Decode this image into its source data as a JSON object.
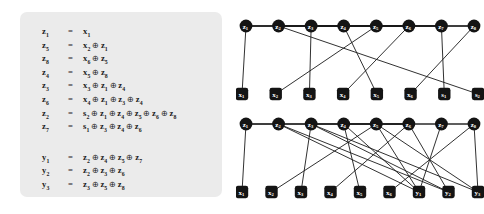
{
  "equations": {
    "z_block": [
      {
        "lhs": "z1",
        "eq": "=",
        "terms": [
          "x1"
        ]
      },
      {
        "lhs": "z5",
        "eq": "=",
        "terms": [
          "x2",
          "z1"
        ]
      },
      {
        "lhs": "z8",
        "eq": "=",
        "terms": [
          "x6",
          "z5"
        ]
      },
      {
        "lhs": "z4",
        "eq": "=",
        "terms": [
          "x5",
          "z8"
        ]
      },
      {
        "lhs": "z3",
        "eq": "=",
        "terms": [
          "x3",
          "z1",
          "z4"
        ]
      },
      {
        "lhs": "z6",
        "eq": "=",
        "terms": [
          "x4",
          "z1",
          "z3",
          "z4"
        ]
      },
      {
        "lhs": "z2",
        "eq": "=",
        "terms": [
          "s2",
          "z1",
          "z4",
          "z5",
          "z6",
          "z8"
        ]
      },
      {
        "lhs": "z7",
        "eq": "=",
        "terms": [
          "s1",
          "z3",
          "z4",
          "z6"
        ]
      }
    ],
    "y_block": [
      {
        "lhs": "y1",
        "eq": "=",
        "terms": [
          "z2",
          "z4",
          "z5",
          "z7"
        ]
      },
      {
        "lhs": "y2",
        "eq": "=",
        "terms": [
          "z2",
          "z3",
          "z6"
        ]
      },
      {
        "lhs": "y3",
        "eq": "=",
        "terms": [
          "z3",
          "z5",
          "z8"
        ]
      }
    ],
    "operator": "⊕",
    "equals": "="
  },
  "graph_top": {
    "top_nodes": [
      "z1",
      "z2",
      "z3",
      "z4",
      "z5",
      "z6",
      "z7",
      "z8"
    ],
    "bottom_nodes": [
      "x1",
      "x2",
      "x3",
      "x4",
      "x5",
      "x6",
      "s1",
      "s2"
    ],
    "edges": [
      [
        "z1",
        "x1"
      ],
      [
        "z5",
        "x2"
      ],
      [
        "z5",
        "z1"
      ],
      [
        "z8",
        "x6"
      ],
      [
        "z8",
        "z5"
      ],
      [
        "z4",
        "x5"
      ],
      [
        "z4",
        "z8"
      ],
      [
        "z3",
        "x3"
      ],
      [
        "z3",
        "z1"
      ],
      [
        "z3",
        "z4"
      ],
      [
        "z6",
        "x4"
      ],
      [
        "z6",
        "z1"
      ],
      [
        "z6",
        "z3"
      ],
      [
        "z6",
        "z4"
      ],
      [
        "z2",
        "s2"
      ],
      [
        "z2",
        "z1"
      ],
      [
        "z2",
        "z4"
      ],
      [
        "z2",
        "z5"
      ],
      [
        "z2",
        "z6"
      ],
      [
        "z2",
        "z8"
      ],
      [
        "z7",
        "s1"
      ],
      [
        "z7",
        "z3"
      ],
      [
        "z7",
        "z4"
      ],
      [
        "z7",
        "z6"
      ]
    ]
  },
  "graph_bottom": {
    "top_nodes": [
      "z1",
      "z2",
      "z3",
      "z4",
      "z5",
      "z6",
      "z7",
      "z8"
    ],
    "bottom_nodes": [
      "x1",
      "x2",
      "x3",
      "x4",
      "x5",
      "x6",
      "y1",
      "y2",
      "y3"
    ],
    "edges": [
      [
        "z1",
        "x1"
      ],
      [
        "z5",
        "x2"
      ],
      [
        "z5",
        "z1"
      ],
      [
        "z8",
        "x6"
      ],
      [
        "z8",
        "z5"
      ],
      [
        "z4",
        "x5"
      ],
      [
        "z4",
        "z8"
      ],
      [
        "z3",
        "x3"
      ],
      [
        "z3",
        "z1"
      ],
      [
        "z3",
        "z4"
      ],
      [
        "z6",
        "x4"
      ],
      [
        "z6",
        "z1"
      ],
      [
        "z6",
        "z3"
      ],
      [
        "z6",
        "z4"
      ],
      [
        "y1",
        "z2"
      ],
      [
        "y1",
        "z4"
      ],
      [
        "y1",
        "z5"
      ],
      [
        "y1",
        "z7"
      ],
      [
        "y2",
        "z2"
      ],
      [
        "y2",
        "z3"
      ],
      [
        "y2",
        "z6"
      ],
      [
        "y3",
        "z3"
      ],
      [
        "y3",
        "z5"
      ],
      [
        "y3",
        "z8"
      ]
    ]
  },
  "colors": {
    "panel_bg": "#ebebeb",
    "node_fill": "#141414",
    "node_label": "#ffffff",
    "edge": "#1a1a1a",
    "text": "#1b1b1b",
    "page_bg": "#ffffff"
  }
}
